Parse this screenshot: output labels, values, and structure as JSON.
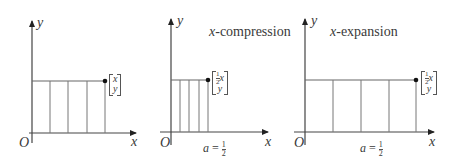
{
  "panels": [
    {
      "id": "original",
      "title": "",
      "axis_labels": {
        "x": "x",
        "y": "y",
        "origin": "O"
      },
      "point_label": {
        "top": "x",
        "bottom": "y"
      },
      "rect_width_units": 4,
      "caption": ""
    },
    {
      "id": "compression",
      "title": "x-compression",
      "title_var": "x",
      "title_rest": "-compression",
      "axis_labels": {
        "x": "x",
        "y": "y",
        "origin": "O"
      },
      "point_label": {
        "top_coef_num": "1",
        "top_coef_den": "2",
        "top_var": "x",
        "bottom": "y"
      },
      "caption": {
        "var": "a",
        "eq": "=",
        "num": "1",
        "den": "2"
      }
    },
    {
      "id": "expansion",
      "title": "x-expansion",
      "title_var": "x",
      "title_rest": "-expansion",
      "axis_labels": {
        "x": "x",
        "y": "y",
        "origin": "O"
      },
      "point_label": {
        "top_coef_num": "1",
        "top_coef_den": "2",
        "top_var": "x",
        "bottom": "y"
      },
      "caption": {
        "var": "a",
        "eq": "=",
        "num": "1",
        "den": "2"
      }
    }
  ],
  "colors": {
    "line": "#666666",
    "axis": "#444444",
    "point": "#111111",
    "text": "#3a3a3a"
  }
}
